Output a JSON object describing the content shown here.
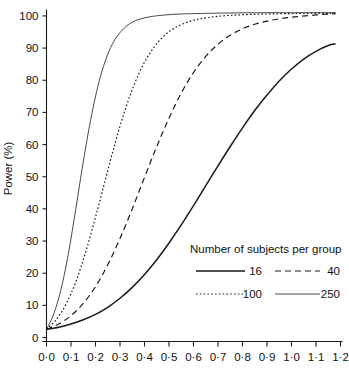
{
  "chart_data": {
    "type": "line",
    "title": "",
    "xlabel": "",
    "ylabel": "Power (%)",
    "xlim": [
      0.0,
      1.2
    ],
    "ylim": [
      0,
      102
    ],
    "grid": false,
    "legend_position": "inside-lower-right",
    "legend_title": "Number of subjects per group",
    "x_tick_labels": [
      "0·0",
      "0·1",
      "0·2",
      "0·3",
      "0·4",
      "0·5",
      "0·6",
      "0·7",
      "0·8",
      "0·9",
      "1·0",
      "1·1",
      "1·2"
    ],
    "x_tick_values": [
      0.0,
      0.1,
      0.2,
      0.3,
      0.4,
      0.5,
      0.6,
      0.7,
      0.8,
      0.9,
      1.0,
      1.1,
      1.2
    ],
    "y_tick_labels": [
      "0",
      "10",
      "20",
      "30",
      "40",
      "50",
      "60",
      "70",
      "80",
      "90",
      "100"
    ],
    "y_tick_values": [
      0,
      10,
      20,
      30,
      40,
      50,
      60,
      70,
      80,
      90,
      100
    ],
    "line_color": "#1a1a1a",
    "series": [
      {
        "name": "16",
        "style": "solid",
        "stroke_width": 1.5,
        "dasharray": "",
        "x": [
          0.0,
          0.05,
          0.1,
          0.15,
          0.2,
          0.25,
          0.3,
          0.35,
          0.4,
          0.45,
          0.5,
          0.55,
          0.6,
          0.65,
          0.7,
          0.75,
          0.8,
          0.85,
          0.9,
          0.95,
          1.0,
          1.05,
          1.1,
          1.15,
          1.18
        ],
        "values": [
          2.5,
          3.2,
          4.2,
          5.5,
          7.2,
          9.4,
          12.2,
          15.6,
          19.6,
          24.2,
          29.4,
          35.0,
          41.0,
          47.2,
          53.4,
          59.4,
          65.2,
          70.6,
          75.4,
          79.8,
          83.5,
          86.6,
          89.0,
          90.8,
          91.3
        ]
      },
      {
        "name": "40",
        "style": "dashed",
        "stroke_width": 1.2,
        "dasharray": "6,4",
        "x": [
          0.0,
          0.05,
          0.1,
          0.15,
          0.2,
          0.25,
          0.3,
          0.35,
          0.4,
          0.45,
          0.5,
          0.55,
          0.6,
          0.65,
          0.7,
          0.75,
          0.8,
          0.85,
          0.9,
          0.95,
          1.0,
          1.1,
          1.18
        ],
        "values": [
          2.5,
          4.2,
          6.8,
          10.6,
          15.8,
          22.6,
          30.8,
          40.0,
          49.8,
          59.4,
          68.2,
          76.0,
          82.4,
          87.4,
          91.2,
          94.0,
          96.0,
          97.4,
          98.4,
          99.1,
          99.6,
          100.3,
          100.7
        ]
      },
      {
        "name": "100",
        "style": "dotted",
        "stroke_width": 1.2,
        "dasharray": "1.6,2.2",
        "x": [
          0.0,
          0.04,
          0.08,
          0.12,
          0.16,
          0.2,
          0.24,
          0.28,
          0.32,
          0.36,
          0.4,
          0.44,
          0.48,
          0.52,
          0.58,
          0.65,
          0.75,
          0.9,
          1.05,
          1.18
        ],
        "values": [
          2.5,
          5.6,
          10.4,
          17.4,
          26.6,
          37.4,
          49.0,
          60.4,
          70.6,
          79.0,
          85.6,
          90.4,
          93.8,
          96.1,
          98.2,
          99.4,
          100.2,
          100.6,
          100.8,
          100.9
        ]
      },
      {
        "name": "250",
        "style": "solid",
        "stroke_width": 0.8,
        "dasharray": "",
        "x": [
          0.0,
          0.03,
          0.06,
          0.09,
          0.12,
          0.15,
          0.18,
          0.21,
          0.24,
          0.27,
          0.3,
          0.34,
          0.4,
          0.5,
          0.65,
          0.85,
          1.05,
          1.18
        ],
        "values": [
          2.5,
          7.4,
          15.2,
          26.4,
          40.2,
          54.6,
          67.6,
          78.2,
          86.0,
          91.4,
          94.8,
          97.6,
          99.4,
          100.4,
          100.8,
          101.0,
          101.0,
          101.0
        ]
      }
    ]
  },
  "legend": {
    "title": "Number of subjects per group",
    "entries": [
      {
        "label": "16",
        "style": "solid"
      },
      {
        "label": "40",
        "style": "dashed"
      },
      {
        "label": "100",
        "style": "dotted"
      },
      {
        "label": "250",
        "style": "thin-solid"
      }
    ]
  }
}
